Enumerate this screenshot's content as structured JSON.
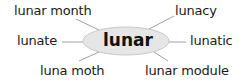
{
  "diagram": {
    "type": "word-web",
    "center": {
      "label": "lunar",
      "fill": "#e6e6e6",
      "stroke": "#c8c8c8"
    },
    "line_color": "#9a9a9a",
    "spokes": [
      {
        "id": "top-left",
        "label": "lunar month"
      },
      {
        "id": "top-right",
        "label": "lunacy"
      },
      {
        "id": "left",
        "label": "lunate"
      },
      {
        "id": "right",
        "label": "lunatic"
      },
      {
        "id": "bottom-left",
        "label": "luna moth"
      },
      {
        "id": "bottom-right",
        "label": "lunar module"
      }
    ]
  }
}
